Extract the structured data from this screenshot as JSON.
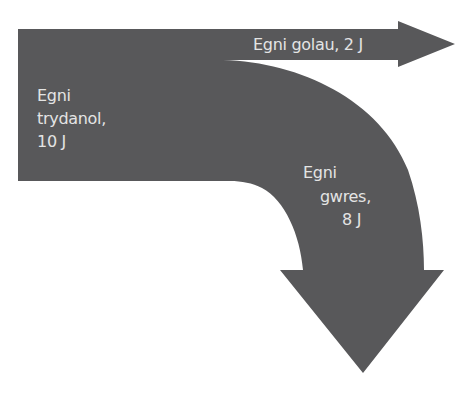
{
  "diagram": {
    "type": "sankey",
    "colors": {
      "flow_fill": "#58585a",
      "label_text": "#e4e4e4",
      "background": "#ffffff"
    },
    "input": {
      "line1": "Egni",
      "line2": "trydanol,",
      "line3": "10 J",
      "value": 10,
      "unit": "J"
    },
    "outputs": [
      {
        "label": "Egni golau, 2 J",
        "value": 2,
        "unit": "J",
        "direction": "right"
      },
      {
        "line1": "Egni",
        "line2": "gwres,",
        "line3": "8 J",
        "value": 8,
        "unit": "J",
        "direction": "down"
      }
    ]
  }
}
